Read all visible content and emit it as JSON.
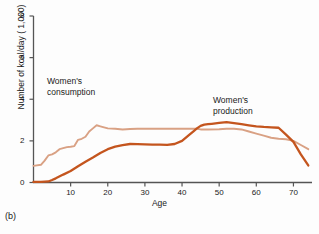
{
  "figure": {
    "panel_label": "(b)",
    "background_color": "#fdfdfd"
  },
  "annotations": {
    "left": {
      "line1": "Women's",
      "line2": "consumption"
    },
    "right": {
      "line1": "Women's",
      "line2": "production"
    }
  },
  "chart_data": {
    "type": "line",
    "title": "",
    "xlabel": "Age",
    "ylabel": "Number of kcal/day ( 1,000)",
    "xlim": [
      0,
      75
    ],
    "ylim": [
      0,
      8
    ],
    "xticks": [
      10,
      20,
      30,
      40,
      50,
      60,
      70
    ],
    "yticks": [
      0,
      2,
      4,
      6,
      8
    ],
    "grid": false,
    "legend_position": "inline-annotations",
    "series": [
      {
        "name": "Women's consumption",
        "color": "#d9a184",
        "x": [
          0,
          2,
          3,
          4,
          5,
          6,
          7,
          8,
          9,
          10,
          11,
          12,
          13,
          14,
          15,
          16,
          17,
          18,
          20,
          22,
          24,
          26,
          28,
          30,
          33,
          36,
          39,
          41,
          43,
          44,
          45,
          47,
          50,
          52,
          54,
          56,
          58,
          60,
          62,
          64,
          66,
          68,
          70,
          72,
          74
        ],
        "y": [
          0.8,
          0.85,
          1.05,
          1.3,
          1.35,
          1.45,
          1.6,
          1.65,
          1.7,
          1.72,
          1.75,
          2.05,
          2.1,
          2.2,
          2.45,
          2.6,
          2.75,
          2.7,
          2.6,
          2.58,
          2.55,
          2.57,
          2.58,
          2.58,
          2.58,
          2.58,
          2.58,
          2.58,
          2.58,
          2.58,
          2.55,
          2.55,
          2.56,
          2.58,
          2.58,
          2.55,
          2.45,
          2.35,
          2.25,
          2.15,
          2.1,
          2.08,
          2.0,
          1.8,
          1.6
        ]
      },
      {
        "name": "Women's production",
        "color": "#c4551e",
        "x": [
          0,
          2,
          4,
          5,
          6,
          8,
          10,
          12,
          14,
          16,
          18,
          20,
          22,
          24,
          26,
          28,
          30,
          32,
          34,
          36,
          38,
          40,
          42,
          43,
          44,
          45,
          46,
          47,
          48,
          50,
          52,
          54,
          56,
          58,
          60,
          62,
          64,
          66,
          68,
          70,
          72,
          74
        ],
        "y": [
          0.03,
          0.03,
          0.05,
          0.12,
          0.2,
          0.38,
          0.55,
          0.78,
          1.0,
          1.2,
          1.42,
          1.6,
          1.72,
          1.8,
          1.85,
          1.84,
          1.83,
          1.82,
          1.82,
          1.81,
          1.85,
          2.0,
          2.3,
          2.45,
          2.6,
          2.72,
          2.78,
          2.8,
          2.82,
          2.86,
          2.9,
          2.85,
          2.8,
          2.75,
          2.7,
          2.67,
          2.65,
          2.63,
          2.3,
          1.95,
          1.35,
          0.82
        ]
      }
    ]
  }
}
